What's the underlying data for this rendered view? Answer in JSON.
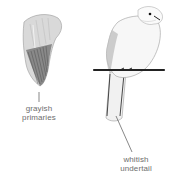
{
  "figure": {
    "annotations": [
      {
        "id": "primaries",
        "line1": "grayish",
        "line2": "primaries"
      },
      {
        "id": "undertail",
        "line1": "whitish",
        "line2": "undertail"
      }
    ],
    "colors": {
      "ink": "#2b2b2b",
      "wing_light": "#bdbdbd",
      "wing_dark": "#555555",
      "label": "#6e6e6e",
      "perch": "#222222"
    }
  }
}
